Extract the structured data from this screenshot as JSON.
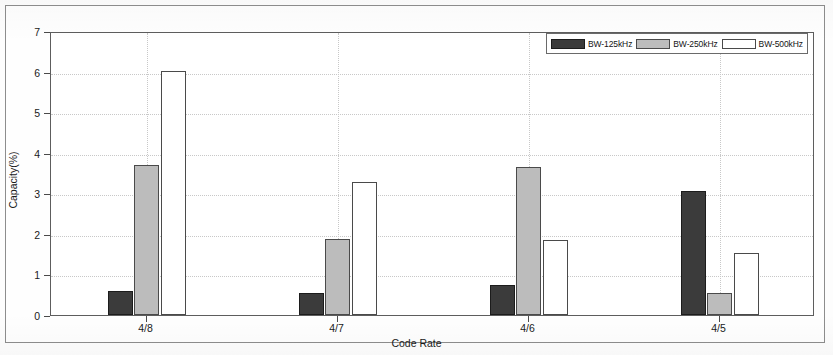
{
  "chart_data": {
    "type": "bar",
    "title": "",
    "xlabel": "Code Rate",
    "ylabel": "Capacity(%)",
    "categories": [
      "4/8",
      "4/7",
      "4/6",
      "4/5"
    ],
    "ylim": [
      0,
      7
    ],
    "yticks": [
      0,
      1,
      2,
      3,
      4,
      5,
      6,
      7
    ],
    "ytick_labels": [
      "0",
      "1",
      "2",
      "3",
      "4",
      "5",
      "6",
      "7"
    ],
    "grid": true,
    "legend_position": "top-right",
    "series": [
      {
        "name": "BW-125kHz",
        "color": "#3b3b3b",
        "values": [
          0.6,
          0.55,
          0.73,
          3.05
        ]
      },
      {
        "name": "BW-250kHz",
        "color": "#bcbcbc",
        "values": [
          3.7,
          1.87,
          3.65,
          0.55
        ]
      },
      {
        "name": "BW-500kHz",
        "color": "#ffffff",
        "values": [
          6.02,
          3.28,
          1.85,
          1.53
        ]
      }
    ]
  },
  "axes": {
    "ylabel": "Capacity(%)",
    "xlabel": "Code Rate",
    "ytick_labels": [
      "0",
      "1",
      "2",
      "3",
      "4",
      "5",
      "6",
      "7"
    ],
    "xtick_labels": [
      "4/8",
      "4/7",
      "4/6",
      "4/5"
    ]
  },
  "legend": {
    "entries": [
      {
        "label": "BW-125kHz",
        "color": "#3b3b3b"
      },
      {
        "label": "BW-250kHz",
        "color": "#bcbcbc"
      },
      {
        "label": "BW-500kHz",
        "color": "#ffffff"
      }
    ]
  }
}
